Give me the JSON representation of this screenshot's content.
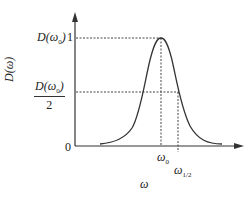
{
  "diagram": {
    "type": "resonance-curve",
    "y_axis_label": "D(ω)",
    "x_axis_label": "ω",
    "y_ticks": {
      "peak_label": "D(ω₀)",
      "peak_label_main": "D(ω",
      "peak_label_sub": "0",
      "peak_label_close": ")",
      "peak_value": "1",
      "half_numerator_main": "D(ω",
      "half_numerator_sub": "0",
      "half_numerator_close": ")",
      "half_denominator": "2",
      "origin": "0"
    },
    "x_ticks": {
      "center_main": "ω",
      "center_sub": "0",
      "half_main": "ω",
      "half_sub": "1/2"
    },
    "colors": {
      "line": "#333333",
      "dashed": "#444444"
    }
  }
}
